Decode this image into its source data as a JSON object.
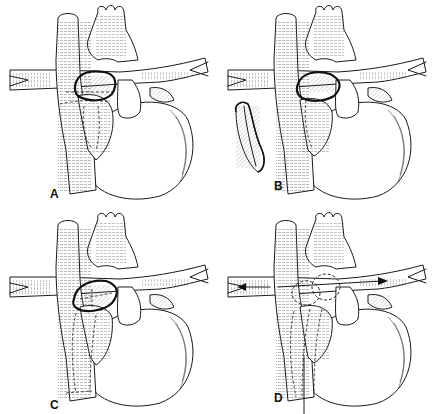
{
  "figure": {
    "layout": "2x2 grid",
    "style": "black-and-white anatomical line drawing",
    "panels": [
      {
        "id": "A",
        "label": "A",
        "position": "top-left"
      },
      {
        "id": "B",
        "label": "B",
        "position": "top-right"
      },
      {
        "id": "C",
        "label": "C",
        "position": "bottom-left"
      },
      {
        "id": "D",
        "label": "D",
        "position": "bottom-right"
      }
    ]
  },
  "colors": {
    "background": "#ffffff",
    "ink": "#1a1a1a"
  }
}
